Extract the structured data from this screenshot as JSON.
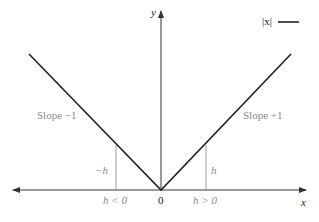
{
  "diagram": {
    "legend": {
      "label": "|x|",
      "color": "#222222"
    },
    "axes": {
      "x_label": "x",
      "y_label": "y",
      "origin_label": "0"
    },
    "annotations": {
      "slope_left": "Slope −1",
      "slope_right": "Slope +1",
      "neg_h": "−h",
      "pos_h": "h",
      "h_lt": "h < 0",
      "h_gt": "h > 0"
    },
    "colors": {
      "curve": "#222222",
      "axis": "#333333",
      "guide": "#9a9a9a",
      "label": "#8a8a8a"
    }
  }
}
